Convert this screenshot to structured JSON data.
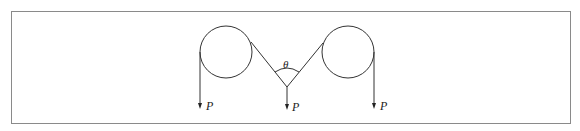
{
  "figure": {
    "labels": {
      "left_load": "P",
      "center_load": "P",
      "right_load": "P",
      "angle": "θ"
    },
    "colors": {
      "line": "#333333",
      "frame": "#8a8a8a"
    },
    "pulleys": [
      {
        "name": "left",
        "cx": 226,
        "cy": 52,
        "r": 26
      },
      {
        "name": "right",
        "cx": 348,
        "cy": 52,
        "r": 26
      }
    ]
  }
}
